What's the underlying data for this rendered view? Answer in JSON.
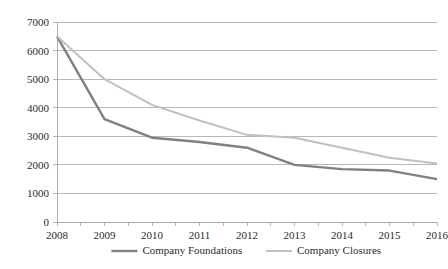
{
  "chart_data": {
    "type": "line",
    "title": "",
    "xlabel": "",
    "ylabel": "",
    "categories": [
      "2008",
      "2009",
      "2010",
      "2011",
      "2012",
      "2013",
      "2014",
      "2015",
      "2016"
    ],
    "series": [
      {
        "name": "Company Foundations",
        "color": "#808080",
        "values": [
          6500,
          3600,
          2950,
          2800,
          2600,
          2000,
          1850,
          1800,
          1500
        ]
      },
      {
        "name": "Company Closures",
        "color": "#c0c0c0",
        "values": [
          6500,
          5000,
          4100,
          3550,
          3050,
          2950,
          2600,
          2250,
          2050
        ]
      }
    ],
    "ylim": [
      0,
      7000
    ],
    "ytick_step": 1000,
    "ytick_labels": [
      "0",
      "1000",
      "2000",
      "3000",
      "4000",
      "5000",
      "6000",
      "7000"
    ],
    "grid": "horizontal",
    "legend_position": "bottom",
    "axis_color": "#a6a6a6",
    "plot_background": "#ffffff"
  },
  "legend": {
    "items": [
      {
        "label": "Company Foundations",
        "color": "#808080"
      },
      {
        "label": "Company Closures",
        "color": "#c0c0c0"
      }
    ]
  }
}
